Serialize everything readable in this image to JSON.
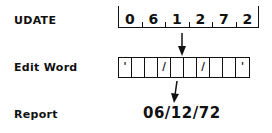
{
  "labels": {
    "udate": "UDATE",
    "edit_word": "Edit Word",
    "report": "Report"
  },
  "udate_field": {
    "digits": [
      "0",
      "6",
      "1",
      "2",
      "7",
      "2"
    ]
  },
  "edit_word": {
    "cells": [
      "'",
      "",
      "",
      "/",
      "",
      "",
      "/",
      "",
      "",
      "'"
    ]
  },
  "report": {
    "value": "06/12/72"
  },
  "icons": {
    "arrow1": "down-arrow-icon",
    "arrow2": "down-arrow-icon"
  }
}
